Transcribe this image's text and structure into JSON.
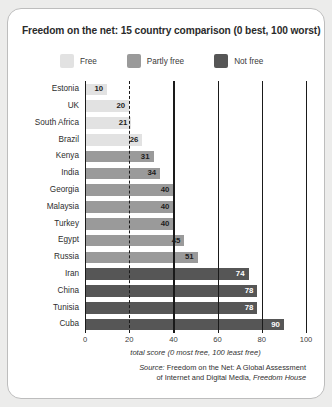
{
  "chart_data": {
    "type": "bar",
    "orientation": "horizontal",
    "title": "Freedom on the net: 15 country comparison (0 best, 100 worst)",
    "xlabel": "total score (0 most free, 100 least free)",
    "ylabel": "",
    "xlim": [
      0,
      100
    ],
    "xticks": [
      0,
      20,
      40,
      60,
      80,
      100
    ],
    "grid": true,
    "legend_position": "top",
    "categories": [
      "Estonia",
      "UK",
      "South Africa",
      "Brazil",
      "Kenya",
      "India",
      "Georgia",
      "Malaysia",
      "Turkey",
      "Egypt",
      "Russia",
      "Iran",
      "China",
      "Tunisia",
      "Cuba"
    ],
    "values": [
      10,
      20,
      21,
      26,
      31,
      34,
      40,
      40,
      40,
      45,
      51,
      74,
      78,
      78,
      90
    ],
    "statuses": [
      "Free",
      "Free",
      "Free",
      "Free",
      "Partly free",
      "Partly free",
      "Partly free",
      "Partly free",
      "Partly free",
      "Partly free",
      "Partly free",
      "Not free",
      "Not free",
      "Not free",
      "Not free"
    ],
    "legend": [
      {
        "label": "Free",
        "color": "#e2e2e2"
      },
      {
        "label": "Partly free",
        "color": "#9a9a9a"
      },
      {
        "label": "Not free",
        "color": "#565656"
      }
    ],
    "colors": {
      "free": "#e2e2e2",
      "partly_free": "#9a9a9a",
      "not_free": "#565656"
    },
    "source": {
      "line1_prefix": "Source:",
      "line1": "Freedom on the Net: A Global Assessment",
      "line2_main": "of Internet and Digital Media,",
      "line2_italic": "Freedom House"
    }
  }
}
